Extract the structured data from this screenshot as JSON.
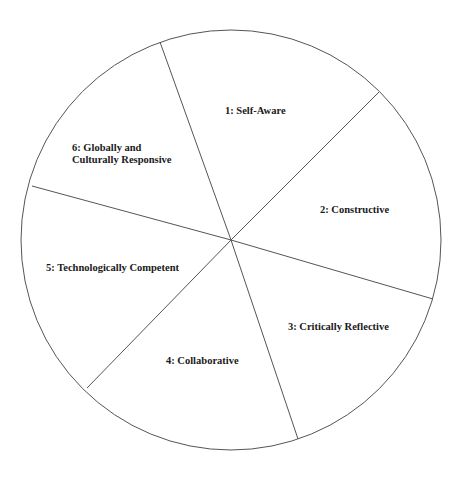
{
  "diagram": {
    "type": "segmented-circle",
    "center": [
      231,
      240
    ],
    "radius": 210,
    "stroke_color": "#555555",
    "background": "#ffffff",
    "text_color": "#1a1a1a",
    "spokes": [
      {
        "from": "center",
        "to": [
          160,
          42
        ]
      },
      {
        "from": "center",
        "to": [
          379,
          92
        ]
      },
      {
        "from": "center",
        "to": [
          433,
          299
        ]
      },
      {
        "from": "center",
        "to": [
          298,
          439
        ]
      },
      {
        "from": "center",
        "to": [
          87,
          388
        ]
      },
      {
        "from": "center",
        "to": [
          32,
          186
        ]
      }
    ],
    "segments": [
      {
        "number": "1",
        "label": "1: Self-Aware",
        "lines": [
          "1: Self-Aware"
        ],
        "pos": [
          225,
          114
        ]
      },
      {
        "number": "2",
        "label": "2: Constructive",
        "lines": [
          "2: Constructive"
        ],
        "pos": [
          320,
          213
        ]
      },
      {
        "number": "3",
        "label": "3: Critically Reflective",
        "lines": [
          "3: Critically Reflective"
        ],
        "pos": [
          288,
          330
        ]
      },
      {
        "number": "4",
        "label": "4: Collaborative",
        "lines": [
          "4: Collaborative"
        ],
        "pos": [
          166,
          364
        ]
      },
      {
        "number": "5",
        "label": "5: Technologically Competent",
        "lines": [
          "5: Technologically Competent"
        ],
        "pos": [
          46,
          271
        ]
      },
      {
        "number": "6",
        "label": "6: Globally and Culturally Responsive",
        "lines": [
          "6: Globally and",
          "Culturally Responsive"
        ],
        "pos": [
          72,
          151
        ]
      }
    ]
  }
}
